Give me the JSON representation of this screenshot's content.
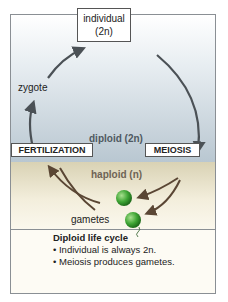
{
  "diagram": {
    "nodes": {
      "individual": {
        "line1": "individual",
        "line2": "(2n)"
      },
      "zygote": "zygote",
      "fertilization": "FERTILIZATION",
      "meiosis": "MEIOSIS",
      "gametes": "gametes"
    },
    "zones": {
      "diploid": "diploid (2n)",
      "haploid": "haploid (n)"
    },
    "legend": {
      "title": "Diploid life cycle",
      "bullets": [
        "• Individual is always 2n.",
        "• Meiosis produces gametes."
      ]
    },
    "colors": {
      "arrow_diploid": "#4b5156",
      "arrow_haploid": "#5a4634",
      "gamete": "#3fa535",
      "diploid_bg": "#b9c7d1",
      "haploid_bg": "#f3eedc"
    }
  }
}
